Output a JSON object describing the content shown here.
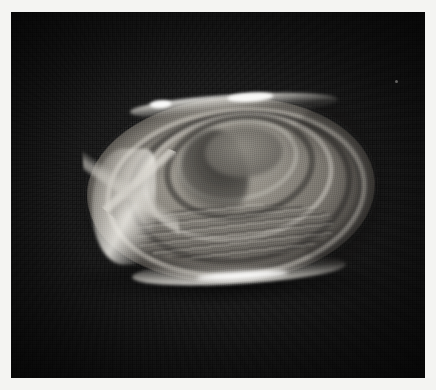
{
  "figure": {
    "kind": "photograph",
    "medium": "black-and-white photographic print",
    "caption": "",
    "border_color": "#f4f4f2"
  },
  "backdrop": {
    "name": "dark woven fabric backdrop",
    "texture": "fine grid weave",
    "color_dark": "#0d0d0d",
    "color_light": "#262626"
  },
  "specimen": {
    "label": "bivalve shell specimen",
    "outline_shape": "ellipse",
    "orientation": "tilted, long axis roughly horizontal",
    "features": [
      {
        "name": "concentric-growth-rings",
        "count": 6
      },
      {
        "name": "umbo-depression"
      },
      {
        "name": "ventral-lamellae-striations"
      },
      {
        "name": "bright-rim-highlight-top"
      },
      {
        "name": "bright-rim-highlight-bottom"
      },
      {
        "name": "bright-margin-left"
      },
      {
        "name": "angular-hinge-wedge-left"
      },
      {
        "name": "shaded-right-limb"
      }
    ],
    "colors": {
      "body_light": "#a8a49b",
      "body_mid": "#77736c",
      "body_dark": "#4a4744",
      "highlight": "#ffffff",
      "groove_dark": "#282624"
    }
  }
}
